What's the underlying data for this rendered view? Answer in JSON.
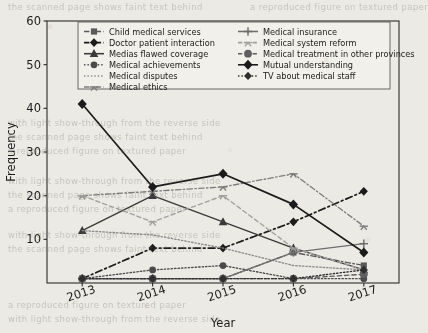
{
  "chart_data": {
    "type": "line",
    "title": "",
    "xlabel": "Year",
    "ylabel": "Frequency",
    "categories": [
      "2013",
      "2014",
      "2015",
      "2016",
      "2017"
    ],
    "x": [
      2013,
      2014,
      2015,
      2016,
      2017
    ],
    "ylim": [
      0,
      60
    ],
    "yticks": [
      10,
      20,
      30,
      40,
      50,
      60
    ],
    "xticks": [
      "2013",
      "2014",
      "2015",
      "2016",
      "2017"
    ],
    "grid": false,
    "legend_position": "upper center",
    "legend_columns": 2,
    "series": [
      {
        "name": "Child medical services",
        "marker": "square",
        "linestyle": "dashdot",
        "color": "#5a5a5a",
        "values": [
          1,
          1,
          1,
          7,
          4
        ]
      },
      {
        "name": "Doctor patient interaction",
        "marker": "diamond",
        "linestyle": "dashdot",
        "color": "#1b1b1b",
        "values": [
          1,
          8,
          8,
          14,
          21
        ]
      },
      {
        "name": "Medias flawed coverage",
        "marker": "triangle",
        "linestyle": "solid",
        "color": "#3a3a3a",
        "values": [
          12,
          20,
          14,
          8,
          3
        ]
      },
      {
        "name": "Medical achievements",
        "marker": "circle",
        "linestyle": "dotted",
        "color": "#4a4a4a",
        "values": [
          1,
          3,
          4,
          1,
          1
        ]
      },
      {
        "name": "Medical disputes",
        "marker": "none",
        "linestyle": "dotted",
        "color": "#8a8a8a",
        "values": [
          12,
          11,
          8,
          4,
          3
        ]
      },
      {
        "name": "Medical ethics",
        "marker": "tri",
        "linestyle": "dashdot",
        "color": "#7d7d7d",
        "values": [
          20,
          21,
          22,
          25,
          13
        ]
      },
      {
        "name": "Medical insurance",
        "marker": "plus",
        "linestyle": "solid",
        "color": "#6e6e6e",
        "values": [
          1,
          1,
          1,
          7,
          9
        ]
      },
      {
        "name": "Medical system reform",
        "marker": "tri",
        "linestyle": "dashed",
        "color": "#a0a0a0",
        "values": [
          20,
          14,
          20,
          8,
          3
        ]
      },
      {
        "name": "Medical treatment in other provinces",
        "marker": "circle-big",
        "linestyle": "dashed",
        "color": "#5f5f5f",
        "values": [
          1,
          1,
          1,
          1,
          2
        ]
      },
      {
        "name": "Mutual understanding",
        "marker": "diamond-big",
        "linestyle": "solid",
        "color": "#1b1b1b",
        "values": [
          41,
          22,
          25,
          18,
          7
        ]
      },
      {
        "name": "TV about medical staff",
        "marker": "diamond-dot",
        "linestyle": "dotted",
        "color": "#2e2e2e",
        "values": [
          1,
          1,
          1,
          1,
          3
        ]
      }
    ]
  },
  "legend": {
    "entries": [
      {
        "label": "Child medical services"
      },
      {
        "label": "Medical insurance"
      },
      {
        "label": "Doctor patient interaction"
      },
      {
        "label": "Medical system reform"
      },
      {
        "label": "Medias flawed coverage"
      },
      {
        "label": "Medical treatment in other provinces"
      },
      {
        "label": "Medical achievements"
      },
      {
        "label": "Mutual understanding"
      },
      {
        "label": "Medical disputes"
      },
      {
        "label": "TV about medical staff"
      },
      {
        "label": "Medical ethics"
      }
    ]
  },
  "background_text": {
    "lines": [
      "the scanned page shows faint text behind",
      "a reproduced figure on textured paper",
      "with light show-through from the reverse side"
    ]
  }
}
